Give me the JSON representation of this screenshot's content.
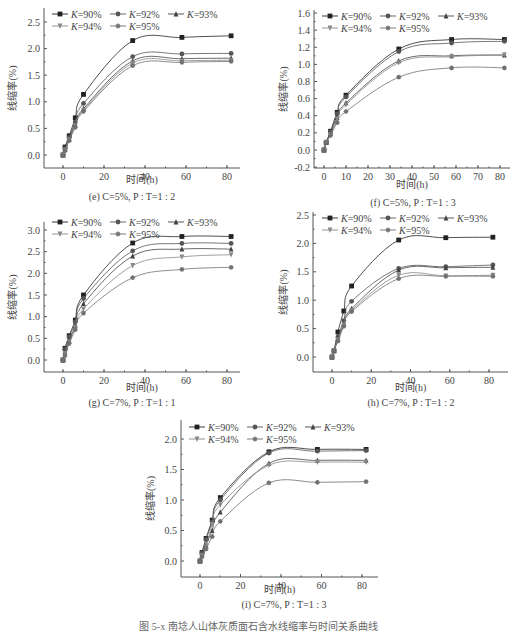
{
  "figure_caption": "图 5-x  南埝人山体灰质面石含水线缩率与时间关系曲线",
  "chart_data": [
    {
      "id": "e",
      "type": "line",
      "title": "(e) C=5%, P : T=1 : 2",
      "xlabel": "时间(h)",
      "ylabel": "线缩率(%)",
      "xlim": [
        -10,
        88
      ],
      "ylim": [
        -0.25,
        2.75
      ],
      "xticks": [
        0,
        20,
        40,
        60,
        80
      ],
      "yticks": [
        0.0,
        0.5,
        1.0,
        1.5,
        2.0,
        2.5
      ],
      "ytick_decimals": 1,
      "legend_position": "top-left inside",
      "x": [
        0,
        1,
        3,
        6,
        10,
        34,
        58,
        82
      ],
      "series": [
        {
          "name": "K=90%",
          "marker": "square",
          "values": [
            0.0,
            0.15,
            0.36,
            0.7,
            1.14,
            2.15,
            2.21,
            2.24
          ]
        },
        {
          "name": "K=92%",
          "marker": "circle",
          "values": [
            0.0,
            0.12,
            0.33,
            0.62,
            0.97,
            1.85,
            1.9,
            1.91
          ]
        },
        {
          "name": "K=93%",
          "marker": "triangle",
          "values": [
            0.0,
            0.1,
            0.3,
            0.58,
            0.87,
            1.77,
            1.81,
            1.82
          ]
        },
        {
          "name": "K=94%",
          "marker": "triangle-down",
          "values": [
            0.0,
            0.09,
            0.29,
            0.55,
            0.84,
            1.73,
            1.77,
            1.78
          ]
        },
        {
          "name": "K=95%",
          "marker": "star",
          "values": [
            0.0,
            0.08,
            0.27,
            0.52,
            0.82,
            1.68,
            1.74,
            1.76
          ]
        }
      ]
    },
    {
      "id": "f",
      "type": "line",
      "title": "(f) C=5%, P : T=1 : 3",
      "xlabel": "时间(h)",
      "ylabel": "线缩率(%)",
      "xlim": [
        -5,
        85
      ],
      "ylim": [
        -0.2,
        1.6
      ],
      "xticks": [
        0,
        10,
        20,
        30,
        40,
        50,
        60,
        70,
        80
      ],
      "yticks": [
        -0.2,
        0.0,
        0.2,
        0.4,
        0.6,
        0.8,
        1.0,
        1.2,
        1.4,
        1.6
      ],
      "ytick_decimals": 1,
      "legend_position": "top-left inside",
      "x": [
        0,
        1,
        3,
        6,
        10,
        34,
        58,
        82
      ],
      "series": [
        {
          "name": "K=90%",
          "marker": "square",
          "values": [
            0.0,
            0.09,
            0.22,
            0.44,
            0.64,
            1.18,
            1.29,
            1.29
          ]
        },
        {
          "name": "K=92%",
          "marker": "circle",
          "values": [
            0.0,
            0.09,
            0.21,
            0.42,
            0.62,
            1.15,
            1.25,
            1.27
          ]
        },
        {
          "name": "K=93%",
          "marker": "triangle",
          "values": [
            0.0,
            0.09,
            0.19,
            0.38,
            0.55,
            1.04,
            1.1,
            1.11
          ]
        },
        {
          "name": "K=94%",
          "marker": "triangle-down",
          "values": [
            0.0,
            0.09,
            0.18,
            0.36,
            0.53,
            1.02,
            1.09,
            1.11
          ]
        },
        {
          "name": "K=95%",
          "marker": "star",
          "values": [
            0.0,
            0.09,
            0.17,
            0.32,
            0.45,
            0.85,
            0.96,
            0.96
          ]
        }
      ]
    },
    {
      "id": "g",
      "type": "line",
      "title": "(g) C=7%, P : T=1 : 1",
      "xlabel": "时间(h)",
      "ylabel": "线缩率(%)",
      "xlim": [
        -10,
        88
      ],
      "ylim": [
        -0.25,
        3.25
      ],
      "xticks": [
        0,
        20,
        40,
        60,
        80
      ],
      "yticks": [
        0.0,
        0.5,
        1.0,
        1.5,
        2.0,
        2.5,
        3.0
      ],
      "ytick_decimals": 1,
      "legend_position": "top-left inside",
      "x": [
        0,
        1,
        3,
        6,
        10,
        34,
        58,
        82
      ],
      "series": [
        {
          "name": "K=90%",
          "marker": "square",
          "values": [
            0.0,
            0.27,
            0.56,
            0.92,
            1.5,
            2.7,
            2.85,
            2.85
          ]
        },
        {
          "name": "K=92%",
          "marker": "circle",
          "values": [
            0.0,
            0.25,
            0.53,
            0.88,
            1.42,
            2.52,
            2.69,
            2.69
          ]
        },
        {
          "name": "K=93%",
          "marker": "triangle",
          "values": [
            0.0,
            0.2,
            0.45,
            0.8,
            1.3,
            2.4,
            2.56,
            2.56
          ]
        },
        {
          "name": "K=94%",
          "marker": "triangle-down",
          "values": [
            0.0,
            0.15,
            0.42,
            0.75,
            1.18,
            2.18,
            2.38,
            2.43
          ]
        },
        {
          "name": "K=95%",
          "marker": "star",
          "values": [
            0.0,
            0.1,
            0.38,
            0.7,
            1.08,
            1.9,
            2.09,
            2.14
          ]
        }
      ]
    },
    {
      "id": "h",
      "type": "line",
      "title": "(h) C=7%, P : T=1 : 2",
      "xlabel": "时间(h)",
      "ylabel": "线缩率(%)",
      "xlim": [
        -10,
        88
      ],
      "ylim": [
        -0.25,
        2.5
      ],
      "xticks": [
        0,
        20,
        40,
        60,
        80
      ],
      "yticks": [
        0.0,
        0.5,
        1.0,
        1.5,
        2.0,
        2.5
      ],
      "ytick_decimals": 1,
      "legend_position": "top-left inside",
      "x": [
        0,
        1,
        3,
        6,
        10,
        34,
        58,
        82
      ],
      "series": [
        {
          "name": "K=90%",
          "marker": "square",
          "values": [
            0.0,
            0.11,
            0.44,
            0.81,
            1.25,
            2.06,
            2.1,
            2.11
          ]
        },
        {
          "name": "K=92%",
          "marker": "circle",
          "values": [
            0.0,
            0.11,
            0.35,
            0.64,
            0.98,
            1.56,
            1.59,
            1.62
          ]
        },
        {
          "name": "K=93%",
          "marker": "triangle",
          "values": [
            0.0,
            0.11,
            0.32,
            0.58,
            0.85,
            1.53,
            1.57,
            1.58
          ]
        },
        {
          "name": "K=94%",
          "marker": "triangle-down",
          "values": [
            0.0,
            0.11,
            0.3,
            0.56,
            0.82,
            1.44,
            1.43,
            1.44
          ]
        },
        {
          "name": "K=95%",
          "marker": "star",
          "values": [
            0.0,
            0.11,
            0.28,
            0.54,
            0.8,
            1.38,
            1.42,
            1.42
          ]
        }
      ]
    },
    {
      "id": "i",
      "type": "line",
      "title": "(i) C=7%, P : T=1 : 3",
      "xlabel": "时间(h)",
      "ylabel": "线缩率(%)",
      "xlim": [
        -10,
        88
      ],
      "ylim": [
        -0.25,
        2.25
      ],
      "xticks": [
        0,
        20,
        40,
        60,
        80
      ],
      "yticks": [
        0.0,
        0.5,
        1.0,
        1.5,
        2.0
      ],
      "ytick_decimals": 1,
      "legend_position": "top-left inside",
      "x": [
        0,
        1,
        3,
        6,
        10,
        34,
        58,
        82
      ],
      "series": [
        {
          "name": "K=90%",
          "marker": "square",
          "values": [
            0.0,
            0.14,
            0.37,
            0.67,
            1.04,
            1.79,
            1.83,
            1.83
          ]
        },
        {
          "name": "K=92%",
          "marker": "circle",
          "values": [
            0.0,
            0.13,
            0.35,
            0.64,
            1.0,
            1.77,
            1.8,
            1.81
          ]
        },
        {
          "name": "K=93%",
          "marker": "triangle",
          "values": [
            0.0,
            0.1,
            0.26,
            0.5,
            0.8,
            1.6,
            1.65,
            1.65
          ]
        },
        {
          "name": "K=94%",
          "marker": "triangle-down",
          "values": [
            0.0,
            0.09,
            0.23,
            0.6,
            0.92,
            1.57,
            1.62,
            1.62
          ]
        },
        {
          "name": "K=95%",
          "marker": "star",
          "values": [
            0.0,
            0.07,
            0.2,
            0.4,
            0.65,
            1.28,
            1.29,
            1.3
          ]
        }
      ]
    }
  ],
  "style": {
    "series_colors": [
      "#222222",
      "#555555",
      "#444444",
      "#888888",
      "#707070"
    ],
    "axis_color": "#555555",
    "text_color": "#444444"
  }
}
